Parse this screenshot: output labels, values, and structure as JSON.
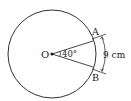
{
  "diagram": {
    "type": "circle-sector",
    "center_label": "O",
    "point_a_label": "A",
    "point_b_label": "B",
    "angle_label": "40°",
    "arc_length_label": "9 cm",
    "colors": {
      "stroke": "#333333",
      "background": "#ffffff"
    }
  }
}
